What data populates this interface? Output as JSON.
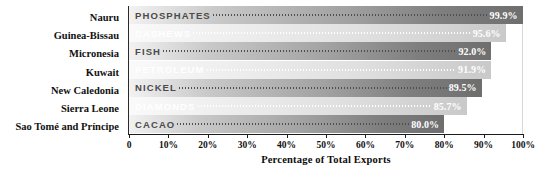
{
  "chart_data": {
    "type": "bar",
    "orientation": "horizontal",
    "title": "",
    "xlabel": "Percentage of Total Exports",
    "ylabel": "",
    "xlim": [
      0,
      100
    ],
    "grid": false,
    "legend": null,
    "categories": [
      "Nauru",
      "Guinea-Bissau",
      "Micronesia",
      "Kuwait",
      "New Caledonia",
      "Sierra Leone",
      "Sao Tomé and Príncipe"
    ],
    "values": [
      99.9,
      95.6,
      92.0,
      91.9,
      89.5,
      85.7,
      80.0
    ],
    "bar_labels": [
      "PHOSPHATES",
      "CASHEWS",
      "FISH",
      "PETROLEUM",
      "NICKEL",
      "DIAMONDS",
      "CACAO"
    ],
    "value_labels": [
      "99.9%",
      "95.6%",
      "92.0%",
      "91.9%",
      "89.5%",
      "85.7%",
      "80.0%"
    ],
    "bar_styles": [
      "dark",
      "light",
      "dark",
      "light",
      "dark",
      "light",
      "dark"
    ],
    "xticks": [
      0,
      10,
      20,
      30,
      40,
      50,
      60,
      70,
      80,
      90,
      100
    ],
    "xtick_labels": [
      "0",
      "10%",
      "20%",
      "30%",
      "40%",
      "50%",
      "60%",
      "70%",
      "80%",
      "90%",
      "100%"
    ]
  },
  "colors": {
    "bar_dark_start": "#f2f2f2",
    "bar_dark_end": "#6e6e6e",
    "bar_light_start": "#fafafa",
    "bar_light_end": "#c9c9c9",
    "axis": "#1c1c1c",
    "text": "#111111",
    "value_text": "#ffffff",
    "background": "#ffffff"
  }
}
